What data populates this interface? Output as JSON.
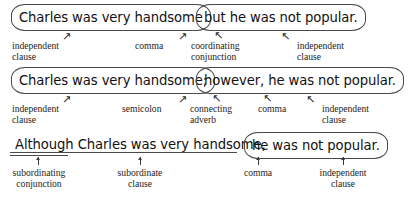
{
  "figure": {
    "line_color": "#4a4a4a",
    "text_color": "#111111",
    "label_color": "#1c1c1c"
  },
  "examples": [
    {
      "id": "compound-coordinating",
      "sentence": "Charles was very handsome, but he was not popular.",
      "parts": [
        {
          "text": "Charles was very handsome",
          "marker": "oval"
        },
        {
          "text": "but he was not popular.",
          "marker": "oval"
        }
      ],
      "annotations": [
        {
          "label": "independent\nclause",
          "arrow": "↗"
        },
        {
          "label": "comma",
          "arrow": "↗"
        },
        {
          "label": "coordinating\nconjunction",
          "arrow": "↖"
        },
        {
          "label": "independent\nclause",
          "arrow": "↖"
        }
      ]
    },
    {
      "id": "compound-conjunctive-adverb",
      "sentence": "Charles was very handsome; however, he was not popular.",
      "parts": [
        {
          "text": "Charles was very handsome;",
          "marker": "oval"
        },
        {
          "text": "however, he was not popular.",
          "marker": "oval"
        }
      ],
      "annotations": [
        {
          "label": "independent\nclause",
          "arrow": "↗"
        },
        {
          "label": "semicolon",
          "arrow": "↗"
        },
        {
          "label": "connecting\nadverb",
          "arrow": "↖"
        },
        {
          "label": "comma",
          "arrow": "↖"
        },
        {
          "label": "independent\nclause",
          "arrow": "↖"
        }
      ]
    },
    {
      "id": "complex-subordinating",
      "sentence": "Although Charles was very handsome, he was not popular.",
      "parts": [
        {
          "text": "Although Charles was very handsome,",
          "marker": "underline"
        },
        {
          "text": "he was not popular.",
          "marker": "oval"
        }
      ],
      "annotations": [
        {
          "label": "subordinating\nconjunction",
          "arrow": "↑"
        },
        {
          "label": "subordinate\nclause",
          "arrow": "↑"
        },
        {
          "label": "comma",
          "arrow": "↑"
        },
        {
          "label": "independent\nclause",
          "arrow": "↑"
        }
      ]
    }
  ]
}
